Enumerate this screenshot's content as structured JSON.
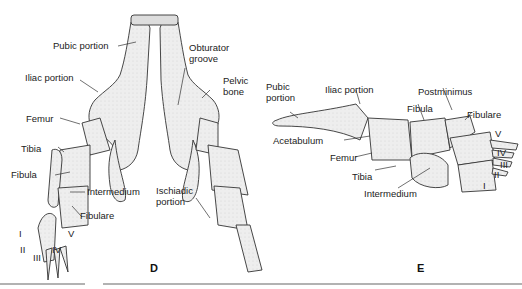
{
  "panels": {
    "D": {
      "letter": "D",
      "labels": {
        "pubic_portion": "Pubic portion",
        "obturator_groove_1": "Obturator",
        "obturator_groove_2": "groove",
        "iliac_portion": "Iliac portion",
        "pelvic_bone_1": "Pelvic",
        "pelvic_bone_2": "bone",
        "femur": "Femur",
        "tibia": "Tibia",
        "fibula": "Fibula",
        "intermedium": "Intermedium",
        "ischiadic_portion_1": "Ischiadic",
        "ischiadic_portion_2": "portion",
        "fibulare": "Fibulare",
        "digit_I": "I",
        "digit_II": "II",
        "digit_III": "III",
        "digit_IV": "IV",
        "digit_V": "V"
      }
    },
    "E": {
      "letter": "E",
      "labels": {
        "pubic_portion_1": "Pubic",
        "pubic_portion_2": "portion",
        "iliac_portion": "Iliac portion",
        "postminimus": "Postminimus",
        "fibula": "Fibula",
        "fibulare": "Fibulare",
        "acetabulum": "Acetabulum",
        "femur": "Femur",
        "tibia": "Tibia",
        "intermedium": "Intermedium",
        "digit_I": "I",
        "digit_II": "II",
        "digit_III": "III",
        "digit_IV": "IV",
        "digit_V": "V"
      }
    }
  },
  "colors": {
    "bone_fill": "#ececec",
    "outline": "#333333",
    "rule": "#999999"
  }
}
